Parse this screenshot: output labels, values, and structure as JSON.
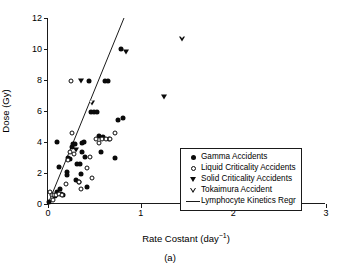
{
  "chart_data": {
    "type": "scatter",
    "title": "",
    "caption": "(a)",
    "xlabel": "Rate Costant (day−1)",
    "ylabel": "Dose (Gy)",
    "xlim": [
      0,
      3
    ],
    "ylim": [
      0,
      12
    ],
    "xticks": [
      0,
      1,
      2,
      3
    ],
    "xtick_labels": [
      "0",
      "1",
      "2",
      "3"
    ],
    "yticks": [
      0,
      2,
      4,
      6,
      8,
      10,
      12
    ],
    "ytick_labels": [
      "0",
      "2",
      "4",
      "6",
      "8",
      "10",
      "12"
    ],
    "grid": false,
    "legend_position": "lower-right",
    "series": [
      {
        "name": "Gamma Accidents",
        "marker": "filled-circle",
        "color": "#0a0a0a",
        "points": [
          [
            0.01,
            0.1
          ],
          [
            0.08,
            0.5
          ],
          [
            0.1,
            0.75
          ],
          [
            0.12,
            2.4
          ],
          [
            0.13,
            0.95
          ],
          [
            0.14,
            0.65
          ],
          [
            0.16,
            0.6
          ],
          [
            0.1,
            4.0
          ],
          [
            0.2,
            2.05
          ],
          [
            0.21,
            1.85
          ],
          [
            0.22,
            3.0
          ],
          [
            0.24,
            2.9
          ],
          [
            0.26,
            3.7
          ],
          [
            0.27,
            3.85
          ],
          [
            0.29,
            3.9
          ],
          [
            0.3,
            1.55
          ],
          [
            0.31,
            2.6
          ],
          [
            0.33,
            1.45
          ],
          [
            0.35,
            2.55
          ],
          [
            0.36,
            1.95
          ],
          [
            0.37,
            3.95
          ],
          [
            0.39,
            4.0
          ],
          [
            0.37,
            3.35
          ],
          [
            0.4,
            3.05
          ],
          [
            0.42,
            1.1
          ],
          [
            0.44,
            7.95
          ],
          [
            0.46,
            5.95
          ],
          [
            0.5,
            5.95
          ],
          [
            0.53,
            5.95
          ],
          [
            0.55,
            4.4
          ],
          [
            0.57,
            3.35
          ],
          [
            0.59,
            4.35
          ],
          [
            0.62,
            7.95
          ],
          [
            0.65,
            7.95
          ],
          [
            0.66,
            4.2
          ],
          [
            0.72,
            3.0
          ],
          [
            0.76,
            5.45
          ],
          [
            0.79,
            10.0
          ],
          [
            0.81,
            5.55
          ]
        ]
      },
      {
        "name": "Liquid Criticality Accidents",
        "marker": "open-circle",
        "color": "#0a0a0a",
        "points": [
          [
            0.02,
            0.75
          ],
          [
            0.04,
            0.55
          ],
          [
            0.05,
            0.25
          ],
          [
            0.07,
            0.6
          ],
          [
            0.09,
            0.55
          ],
          [
            0.12,
            0.65
          ],
          [
            0.15,
            0.6
          ],
          [
            0.19,
            1.3
          ],
          [
            0.22,
            2.85
          ],
          [
            0.24,
            3.35
          ],
          [
            0.25,
            7.95
          ],
          [
            0.26,
            4.55
          ],
          [
            0.28,
            3.25
          ],
          [
            0.33,
            1.4
          ],
          [
            0.36,
            0.95
          ],
          [
            0.42,
            2.3
          ],
          [
            0.45,
            3.05
          ],
          [
            0.47,
            1.65
          ],
          [
            0.52,
            4.2
          ],
          [
            0.55,
            3.95
          ],
          [
            0.58,
            4.2
          ],
          [
            0.63,
            4.2
          ],
          [
            0.67,
            4.2
          ],
          [
            0.72,
            4.55
          ]
        ]
      },
      {
        "name": "Solid Criticality Accidents",
        "marker": "filled-triangle-down",
        "color": "#0a0a0a",
        "points": [
          [
            0.3,
            3.5
          ],
          [
            0.36,
            7.95
          ],
          [
            0.84,
            9.8
          ],
          [
            1.25,
            6.9
          ]
        ]
      },
      {
        "name": "Tokaimura Accident",
        "marker": "open-triangle-down",
        "color": "#0a0a0a",
        "points": [
          [
            0.47,
            6.5
          ],
          [
            1.45,
            11.0
          ]
        ]
      },
      {
        "name": "Lymphocyte Kinetics Regr",
        "marker": "line",
        "color": "#1a1a1a",
        "line": {
          "x0": 0.0,
          "y0": 0.0,
          "x1": 0.82,
          "y1": 12.0,
          "slope": 14.63,
          "intercept": 0.0
        }
      }
    ]
  }
}
